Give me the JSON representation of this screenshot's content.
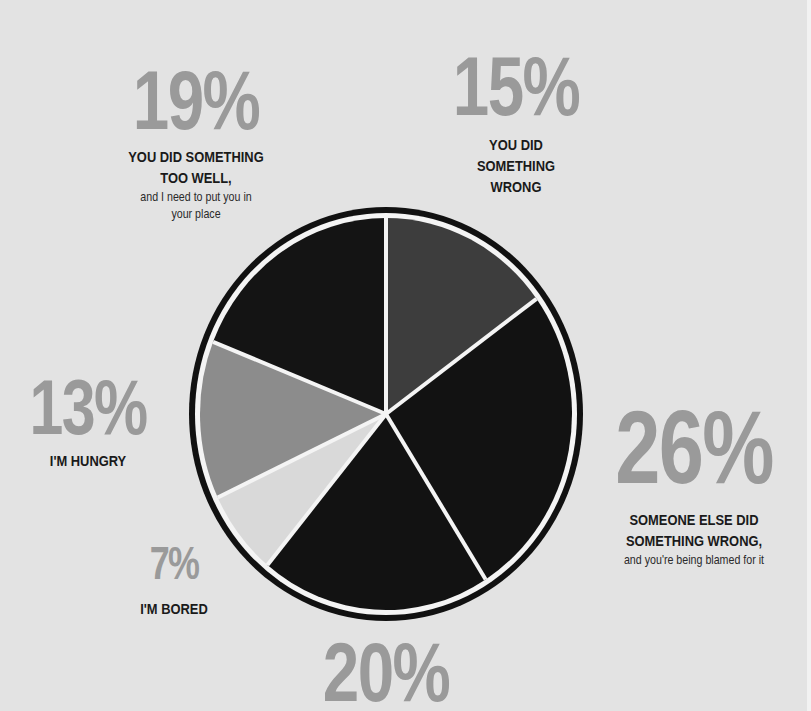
{
  "chart_data": {
    "type": "pie",
    "title": "",
    "start_angle_deg": 0,
    "direction": "clockwise",
    "categories": [
      "You did something wrong",
      "Someone else did something wrong, and you're being blamed for it",
      "(unlabeled)",
      "I'm bored",
      "I'm hungry",
      "You did something too well, and I need to put you in your place"
    ],
    "values": [
      15,
      26,
      20,
      7,
      13,
      19
    ],
    "colors": [
      "#3d3d3d",
      "#121212",
      "#121212",
      "#d9d9d9",
      "#8c8c8c",
      "#141414"
    ]
  },
  "labels": [
    {
      "pct": "19%",
      "head": [
        "YOU DID SOMETHING",
        "TOO WELL,"
      ],
      "sub": [
        "and I need to put you in",
        "your place"
      ]
    },
    {
      "pct": "15%",
      "head": [
        "YOU DID",
        "SOMETHING",
        "WRONG"
      ],
      "sub": []
    },
    {
      "pct": "13%",
      "head": [
        "I'M HUNGRY"
      ],
      "sub": []
    },
    {
      "pct": "26%",
      "head": [
        "SOMEONE ELSE DID",
        "SOMETHING WRONG,"
      ],
      "sub": [
        "and you're being blamed for it"
      ]
    },
    {
      "pct": "7%",
      "head": [
        "I'M BORED"
      ],
      "sub": []
    },
    {
      "pct": "20%",
      "head": [],
      "sub": []
    }
  ],
  "style": {
    "background": "#e3e3e3",
    "pct_color": "#9a9a9a",
    "text_color": "#1a1a1a",
    "ring_color": "#111111",
    "divider_color": "#f4f4f4"
  }
}
